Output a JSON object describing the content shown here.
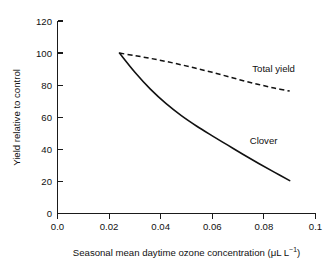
{
  "chart_data": {
    "type": "line",
    "title": "",
    "xlabel": "Seasonal mean daytime ozone concentration (μL L⁻¹)",
    "ylabel": "Yield relative to control",
    "xlim": [
      0.0,
      0.1
    ],
    "ylim": [
      0,
      120
    ],
    "grid": false,
    "legend_position": "inline-annotation",
    "xticks": [
      "0.0",
      "0.02",
      "0.04",
      "0.06",
      "0.08",
      "0.1"
    ],
    "xtick_values": [
      0.0,
      0.02,
      0.04,
      0.06,
      0.08,
      0.1
    ],
    "yticks": [
      "0",
      "20",
      "40",
      "60",
      "80",
      "100",
      "120"
    ],
    "ytick_values": [
      0,
      20,
      40,
      60,
      80,
      100,
      120
    ],
    "series": [
      {
        "name": "Total yield",
        "style": "dashed",
        "color": "#111111",
        "x": [
          0.024,
          0.03,
          0.036,
          0.042,
          0.048,
          0.054,
          0.06,
          0.066,
          0.072,
          0.078,
          0.084,
          0.09
        ],
        "values": [
          100.0,
          98.4,
          96.7,
          94.8,
          92.7,
          90.4,
          88.0,
          85.4,
          82.8,
          80.4,
          78.2,
          76.3
        ]
      },
      {
        "name": "Clover",
        "style": "solid",
        "color": "#111111",
        "x": [
          0.024,
          0.03,
          0.036,
          0.042,
          0.048,
          0.054,
          0.06,
          0.066,
          0.072,
          0.078,
          0.084,
          0.09
        ],
        "values": [
          100.0,
          88.0,
          77.5,
          68.6,
          61.0,
          54.4,
          48.4,
          42.6,
          36.8,
          31.2,
          25.8,
          20.5
        ]
      }
    ],
    "annotations": [
      {
        "text": "Total yield",
        "x": 0.0755,
        "y": 88.0
      },
      {
        "text": "Clover",
        "x": 0.0745,
        "y": 43.5
      }
    ]
  },
  "axis": {
    "xlabel_main": "Seasonal mean daytime ozone concentration (",
    "xlabel_unit": "μL L",
    "xlabel_exponent": "−1",
    "xlabel_close": ")",
    "ylabel": "Yield relative to control"
  }
}
